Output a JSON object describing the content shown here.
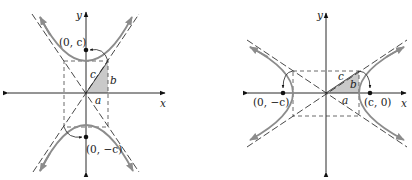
{
  "figure": {
    "left": {
      "orientation": "vertical-transverse-axis",
      "axis_labels": {
        "x": "x",
        "y": "y"
      },
      "foci_labels": {
        "top": "(0, c)",
        "bottom": "(0, −c)"
      },
      "triangle_labels": {
        "hypotenuse": "c",
        "vertical": "b",
        "horizontal": "a"
      }
    },
    "right": {
      "orientation": "horizontal-transverse-axis",
      "axis_labels": {
        "x": "x",
        "y": "y"
      },
      "foci_labels": {
        "left": "(0, −c)",
        "right": "(c, 0)"
      },
      "triangle_labels": {
        "hypotenuse": "c",
        "vertical": "b",
        "horizontal": "a"
      }
    },
    "colors": {
      "axis": "#2a2a2a",
      "curve": "#8c8c8c",
      "triangle_fill": "#c9c9c9",
      "background": "#ffffff"
    }
  }
}
